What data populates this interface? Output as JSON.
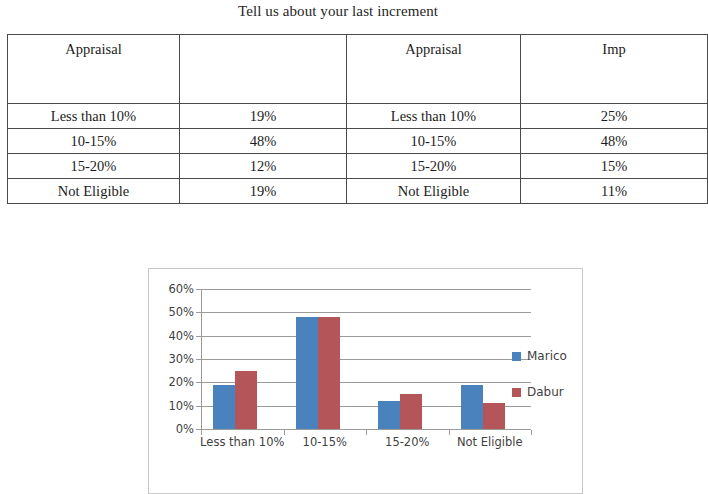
{
  "page": {
    "title": "Tell us about your last increment"
  },
  "table": {
    "columns": [
      {
        "header": "Appraisal"
      },
      {
        "header": ""
      },
      {
        "header": "Appraisal"
      },
      {
        "header": "Imp"
      }
    ],
    "rows": [
      [
        "Less than 10%",
        "19%",
        "Less than 10%",
        "25%"
      ],
      [
        "10-15%",
        "48%",
        "10-15%",
        "48%"
      ],
      [
        "15-20%",
        "12%",
        "15-20%",
        "15%"
      ],
      [
        "Not Eligible",
        "19%",
        "Not Eligible",
        "11%"
      ]
    ]
  },
  "chart_data": {
    "type": "bar",
    "title": "",
    "xlabel": "",
    "ylabel": "",
    "categories": [
      "Less than 10%",
      "10-15%",
      "15-20%",
      "Not Eligible"
    ],
    "series": [
      {
        "name": "Marico",
        "color": "#4a82bd",
        "values": [
          19,
          48,
          12,
          19
        ]
      },
      {
        "name": "Dabur",
        "color": "#b4555a",
        "values": [
          25,
          48,
          15,
          11
        ]
      }
    ],
    "ylim": [
      0,
      60
    ],
    "yticks": [
      0,
      10,
      20,
      30,
      40,
      50,
      60
    ],
    "ytick_labels": [
      "0%",
      "10%",
      "20%",
      "30%",
      "40%",
      "50%",
      "60%"
    ],
    "grid": true,
    "legend_position": "right",
    "value_suffix": "%"
  }
}
